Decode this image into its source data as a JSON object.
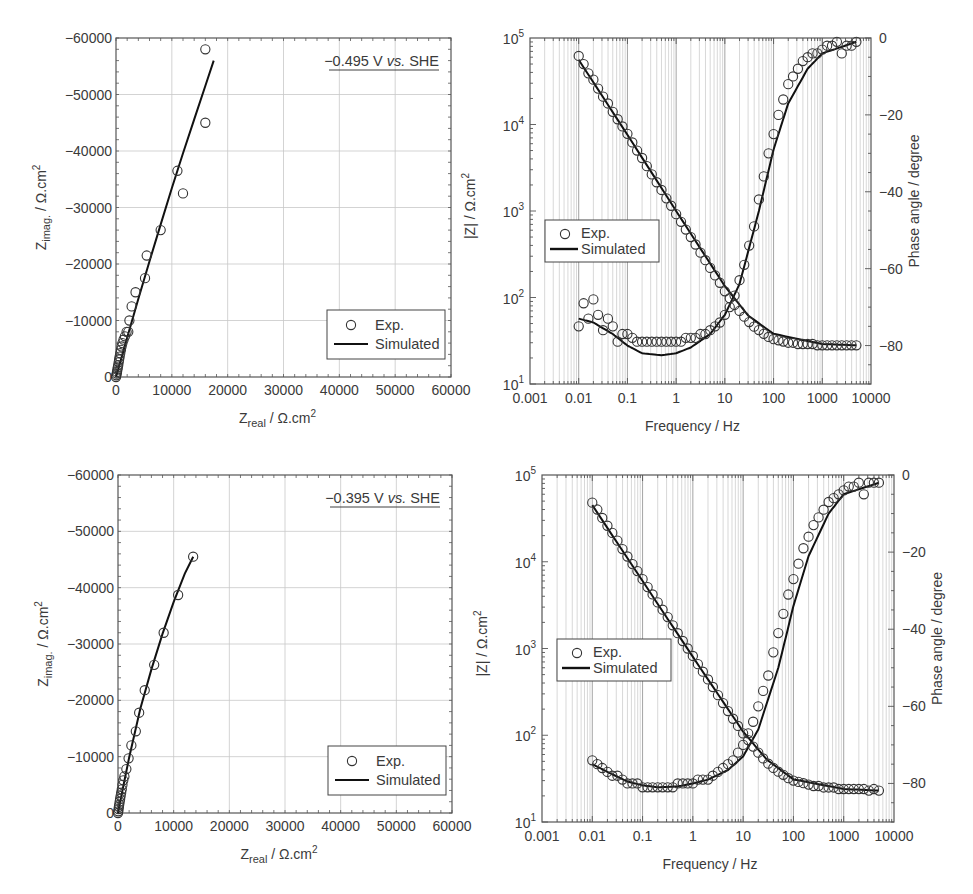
{
  "chart_data": [
    {
      "id": "nyquist_top",
      "type": "scatter",
      "title": "",
      "annotation": "−0.495 V vs. SHE",
      "annotation_parts": [
        "−0.495 V ",
        "vs.",
        " SHE"
      ],
      "xlabel": "Z_real / Ω.cm²",
      "xlabel_main": "Z",
      "xlabel_sub": "real",
      "xlabel_rest": " / Ω.cm",
      "xlabel_sup": "2",
      "ylabel": "Z_imag. / Ω.cm²",
      "ylabel_main": "Z",
      "ylabel_sub": "imag.",
      "ylabel_rest": " / Ω.cm",
      "ylabel_sup": "2",
      "xlim": [
        0,
        60000
      ],
      "ylim": [
        0,
        -60000
      ],
      "xticks": [
        "0",
        "10000",
        "20000",
        "30000",
        "40000",
        "50000",
        "60000"
      ],
      "yticks": [
        "0",
        "−10000",
        "−20000",
        "−30000",
        "−40000",
        "−50000",
        "−60000"
      ],
      "grid": true,
      "legend": {
        "position": "lower right",
        "entries": [
          "Exp.",
          "Simulated"
        ]
      },
      "series": [
        {
          "name": "Exp.",
          "marker": "open-circle",
          "x": [
            0,
            60,
            120,
            180,
            250,
            320,
            400,
            480,
            560,
            650,
            760,
            880,
            1000,
            1150,
            1350,
            1600,
            1900,
            2200,
            2400,
            2800,
            3500,
            5200,
            5500,
            8000,
            11000,
            12000,
            16000,
            16000
          ],
          "y": [
            0,
            -300,
            -600,
            -900,
            -1300,
            -1700,
            -2100,
            -2600,
            -3100,
            -3600,
            -4200,
            -4800,
            -5400,
            -6000,
            -6600,
            -7200,
            -8000,
            -8000,
            -10000,
            -12500,
            -15000,
            -17500,
            -21500,
            -26000,
            -36500,
            -32500,
            -45000,
            -58000
          ]
        },
        {
          "name": "Simulated",
          "line": "solid",
          "x": [
            0,
            2000,
            4000,
            6000,
            8000,
            10000,
            12000,
            14000,
            16000,
            17500
          ],
          "y": [
            0,
            -7000,
            -13800,
            -20500,
            -27000,
            -33400,
            -39600,
            -45600,
            -51500,
            -56000
          ]
        }
      ]
    },
    {
      "id": "bode_top",
      "type": "scatter",
      "title": "",
      "xlabel": "Frequency / Hz",
      "ylabel": "|Z| / Ω.cm²",
      "ylabel_main": "|Z| / Ω.cm",
      "ylabel_sup": "2",
      "ylabel_right": "Phase angle / degree",
      "xscale": "log",
      "xlim": [
        0.001,
        10000
      ],
      "xticks": [
        "0.001",
        "0.01",
        "0.1",
        "1",
        "10",
        "100",
        "1000",
        "10000"
      ],
      "yscale": "log",
      "ylim": [
        10,
        100000
      ],
      "yticks": [
        {
          "base": "10",
          "exp": "1"
        },
        {
          "base": "10",
          "exp": "2"
        },
        {
          "base": "10",
          "exp": "3"
        },
        {
          "base": "10",
          "exp": "4"
        },
        {
          "base": "10",
          "exp": "5"
        }
      ],
      "ylim_right": [
        -90,
        0
      ],
      "yticks_right": [
        "0",
        "−20",
        "−40",
        "−60",
        "−80"
      ],
      "grid": "vertical log minor",
      "legend": {
        "position": "center left",
        "entries": [
          "Exp.",
          "Simulated"
        ]
      },
      "series": [
        {
          "name": "|Z| Exp.",
          "axis": "left",
          "marker": "open-circle",
          "x": [
            0.01,
            0.0126,
            0.0158,
            0.02,
            0.025,
            0.0316,
            0.0398,
            0.05,
            0.063,
            0.079,
            0.1,
            0.126,
            0.158,
            0.2,
            0.25,
            0.316,
            0.398,
            0.5,
            0.63,
            0.79,
            1,
            1.26,
            1.58,
            2,
            2.5,
            3.16,
            3.98,
            5,
            6.3,
            7.9,
            10,
            12.6,
            15.8,
            20,
            25,
            31.6,
            39.8,
            50,
            63,
            79,
            100,
            126,
            158,
            200,
            251,
            316,
            398,
            501,
            631,
            794,
            1000,
            1259,
            1585,
            1995,
            2512,
            3162,
            3981,
            5012
          ],
          "y": [
            62000,
            50000,
            39000,
            33000,
            26000,
            21000,
            17500,
            14000,
            11500,
            9500,
            7800,
            6200,
            5000,
            4100,
            3300,
            2650,
            2150,
            1750,
            1400,
            1150,
            920,
            750,
            610,
            500,
            410,
            330,
            270,
            220,
            180,
            148,
            118,
            98,
            82,
            70,
            60,
            52,
            46,
            42,
            38,
            35,
            33,
            32,
            31,
            30,
            30,
            29,
            29,
            29,
            29,
            28,
            28,
            28,
            28,
            28,
            28,
            28,
            28,
            28
          ]
        },
        {
          "name": "|Z| Simulated",
          "axis": "left",
          "line": "solid",
          "x": [
            0.01,
            0.1,
            1,
            10,
            30,
            100,
            1000,
            5000
          ],
          "y": [
            56000,
            7600,
            1000,
            135,
            62,
            38,
            29,
            28
          ]
        },
        {
          "name": "Phase Exp.",
          "axis": "right",
          "marker": "open-circle",
          "x": [
            0.01,
            0.0126,
            0.0158,
            0.02,
            0.025,
            0.0316,
            0.0398,
            0.05,
            0.063,
            0.079,
            0.1,
            0.126,
            0.158,
            0.2,
            0.25,
            0.316,
            0.398,
            0.5,
            0.63,
            0.79,
            1,
            1.26,
            1.58,
            2,
            2.5,
            3.16,
            3.98,
            5,
            6.3,
            7.9,
            10,
            12.6,
            15.8,
            20,
            25,
            31.6,
            39.8,
            50,
            63,
            79,
            100,
            126,
            158,
            200,
            251,
            316,
            398,
            501,
            631,
            794,
            1000,
            1259,
            1585,
            1995,
            2512,
            3162,
            3981,
            5012
          ],
          "y": [
            -75,
            -69,
            -73,
            -68,
            -72,
            -76,
            -73,
            -75,
            -79,
            -77,
            -77,
            -78,
            -79,
            -79,
            -79,
            -79,
            -79,
            -79,
            -79,
            -79,
            -79,
            -79,
            -78,
            -78,
            -78,
            -77,
            -77,
            -76,
            -75,
            -74,
            -72,
            -70,
            -67,
            -63,
            -59,
            -54,
            -49,
            -42,
            -36,
            -30,
            -25,
            -20,
            -16,
            -12,
            -10,
            -8,
            -6,
            -5,
            -4,
            -4,
            -3,
            -2,
            -2,
            -1,
            -4,
            -2,
            -2,
            -1
          ]
        },
        {
          "name": "Phase Simulated",
          "axis": "right",
          "line": "solid",
          "x": [
            0.01,
            0.02,
            0.05,
            0.1,
            0.2,
            0.5,
            1,
            2,
            5,
            10,
            20,
            50,
            100,
            200,
            500,
            1000,
            5000
          ],
          "y": [
            -73,
            -74,
            -77,
            -80,
            -82,
            -82.5,
            -82,
            -80.5,
            -77,
            -72,
            -64,
            -45,
            -29,
            -17,
            -8,
            -4,
            -1
          ]
        }
      ]
    },
    {
      "id": "nyquist_bottom",
      "type": "scatter",
      "title": "",
      "annotation": "−0.395 V vs. SHE",
      "annotation_parts": [
        "−0.395 V ",
        "vs.",
        " SHE"
      ],
      "xlabel": "Z_real / Ω.cm²",
      "xlabel_main": "Z",
      "xlabel_sub": "real",
      "xlabel_rest": " / Ω.cm",
      "xlabel_sup": "2",
      "ylabel": "Z_imag. / Ω.cm²",
      "ylabel_main": "Z",
      "ylabel_sub": "imag.",
      "ylabel_rest": " / Ω.cm",
      "ylabel_sup": "2",
      "xlim": [
        0,
        60000
      ],
      "ylim": [
        0,
        -60000
      ],
      "xticks": [
        "0",
        "10000",
        "20000",
        "30000",
        "40000",
        "50000",
        "60000"
      ],
      "yticks": [
        "0",
        "−10000",
        "−20000",
        "−30000",
        "−40000",
        "−50000",
        "−60000"
      ],
      "grid": true,
      "legend": {
        "position": "lower right",
        "entries": [
          "Exp.",
          "Simulated"
        ]
      },
      "series": [
        {
          "name": "Exp.",
          "marker": "open-circle",
          "x": [
            0,
            50,
            100,
            160,
            220,
            300,
            380,
            470,
            570,
            680,
            800,
            950,
            1150,
            1500,
            1900,
            2400,
            3200,
            3800,
            4800,
            6500,
            8200,
            10800,
            13500
          ],
          "y": [
            0,
            -300,
            -700,
            -1100,
            -1500,
            -2000,
            -2500,
            -3000,
            -3600,
            -4200,
            -5000,
            -5800,
            -6500,
            -7800,
            -9700,
            -12000,
            -14500,
            -17800,
            -21800,
            -26300,
            -32000,
            -38700,
            -45500
          ]
        },
        {
          "name": "Simulated",
          "line": "solid",
          "x": [
            0,
            1000,
            2000,
            4000,
            6000,
            8000,
            10000,
            12000,
            13500
          ],
          "y": [
            0,
            -5000,
            -9800,
            -18500,
            -25500,
            -31800,
            -37500,
            -42500,
            -45500
          ]
        }
      ]
    },
    {
      "id": "bode_bottom",
      "type": "scatter",
      "title": "",
      "xlabel": "Frequency / Hz",
      "ylabel": "|Z| / Ω.cm²",
      "ylabel_main": "|Z| / Ω.cm",
      "ylabel_sup": "2",
      "ylabel_right": "Phase angle / degree",
      "xscale": "log",
      "xlim": [
        0.001,
        10000
      ],
      "xticks": [
        "0.001",
        "0.01",
        "0.1",
        "1",
        "10",
        "100",
        "1000",
        "10000"
      ],
      "yscale": "log",
      "ylim": [
        10,
        100000
      ],
      "yticks": [
        {
          "base": "10",
          "exp": "1"
        },
        {
          "base": "10",
          "exp": "2"
        },
        {
          "base": "10",
          "exp": "3"
        },
        {
          "base": "10",
          "exp": "4"
        },
        {
          "base": "10",
          "exp": "5"
        }
      ],
      "ylim_right": [
        -90,
        0
      ],
      "yticks_right": [
        "0",
        "−20",
        "−40",
        "−60",
        "−80"
      ],
      "grid": "vertical log minor",
      "legend": {
        "position": "center left",
        "entries": [
          "Exp.",
          "Simulated"
        ]
      },
      "series": [
        {
          "name": "|Z| Exp.",
          "axis": "left",
          "marker": "open-circle",
          "x": [
            0.01,
            0.0126,
            0.0158,
            0.02,
            0.025,
            0.0316,
            0.0398,
            0.05,
            0.063,
            0.079,
            0.1,
            0.126,
            0.158,
            0.2,
            0.25,
            0.316,
            0.398,
            0.5,
            0.63,
            0.79,
            1,
            1.26,
            1.58,
            2,
            2.5,
            3.16,
            3.98,
            5,
            6.3,
            7.9,
            10,
            12.6,
            15.8,
            20,
            25,
            31.6,
            39.8,
            50,
            63,
            79,
            100,
            126,
            158,
            200,
            251,
            316,
            398,
            501,
            631,
            794,
            1000,
            1259,
            1585,
            1995,
            2512,
            3162,
            3981,
            5012
          ],
          "y": [
            48000,
            40000,
            32000,
            26000,
            21500,
            17500,
            14000,
            11500,
            9400,
            7800,
            6300,
            5100,
            4200,
            3400,
            2800,
            2300,
            1850,
            1500,
            1220,
            1000,
            820,
            660,
            540,
            440,
            360,
            290,
            235,
            190,
            155,
            128,
            105,
            88,
            74,
            63,
            54,
            47,
            42,
            38,
            35,
            32,
            30,
            29,
            28,
            27,
            26,
            26,
            25,
            25,
            25,
            24,
            24,
            24,
            24,
            24,
            24,
            23,
            24,
            23
          ]
        },
        {
          "name": "|Z| Simulated",
          "axis": "left",
          "line": "solid",
          "x": [
            0.01,
            0.1,
            1,
            10,
            30,
            100,
            1000,
            5000
          ],
          "y": [
            45000,
            6000,
            800,
            110,
            52,
            31,
            24,
            23
          ]
        },
        {
          "name": "Phase Exp.",
          "axis": "right",
          "marker": "open-circle",
          "x": [
            0.01,
            0.0126,
            0.0158,
            0.02,
            0.025,
            0.0316,
            0.0398,
            0.05,
            0.063,
            0.079,
            0.1,
            0.126,
            0.158,
            0.2,
            0.25,
            0.316,
            0.398,
            0.5,
            0.63,
            0.79,
            1,
            1.26,
            1.58,
            2,
            2.5,
            3.16,
            3.98,
            5,
            6.3,
            7.9,
            10,
            12.6,
            15.8,
            20,
            25,
            31.6,
            39.8,
            50,
            63,
            79,
            100,
            126,
            158,
            200,
            251,
            316,
            398,
            501,
            631,
            794,
            1000,
            1259,
            1585,
            1995,
            2512,
            3162,
            3981,
            5012
          ],
          "y": [
            -74,
            -75,
            -76,
            -77,
            -78,
            -78,
            -79,
            -80,
            -80,
            -80,
            -81,
            -81,
            -81,
            -81,
            -81,
            -81,
            -81,
            -80,
            -80,
            -80,
            -80,
            -79,
            -79,
            -79,
            -78,
            -77,
            -76,
            -75,
            -74,
            -72,
            -70,
            -67,
            -64,
            -60,
            -56,
            -52,
            -46,
            -41,
            -36,
            -31,
            -27,
            -23,
            -19,
            -16,
            -13,
            -11,
            -9,
            -7,
            -6,
            -5,
            -4,
            -3,
            -3,
            -2,
            -5,
            -2,
            -2,
            -2
          ]
        },
        {
          "name": "Phase Simulated",
          "axis": "right",
          "line": "solid",
          "x": [
            0.01,
            0.02,
            0.05,
            0.1,
            0.2,
            0.5,
            1,
            2,
            5,
            10,
            20,
            50,
            100,
            200,
            500,
            1000,
            5000
          ],
          "y": [
            -75,
            -77,
            -79.5,
            -80.5,
            -81,
            -80.8,
            -80,
            -79,
            -76.5,
            -73,
            -66,
            -50,
            -34,
            -21,
            -10,
            -5,
            -2
          ]
        }
      ]
    }
  ]
}
